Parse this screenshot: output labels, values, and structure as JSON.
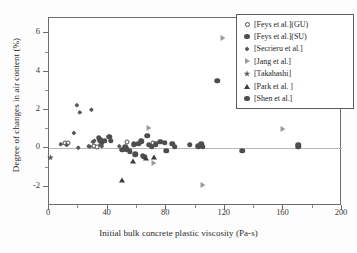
{
  "chart_data": {
    "type": "scatter",
    "title": "",
    "xlabel": "Initial bulk concrete plastic viscosity (Pa-s)",
    "ylabel": "Degree of changes in air content (%)",
    "xlim": [
      0,
      200
    ],
    "ylim": [
      -3,
      6.8
    ],
    "xticks": [
      0,
      40,
      80,
      120,
      160,
      200
    ],
    "yticks": [
      6,
      4,
      2,
      0,
      -2
    ],
    "grid": false,
    "zero_line": true,
    "legend_position": "top-right",
    "series": [
      {
        "name": "[Feys et al.](GU)",
        "marker": "open-circle",
        "color": "#4a4a4a",
        "points": [
          {
            "x": 11,
            "y": 0.3
          },
          {
            "x": 13,
            "y": 0.28
          },
          {
            "x": 31,
            "y": 0.12
          },
          {
            "x": 33,
            "y": 0.1
          },
          {
            "x": 53,
            "y": 0.34
          },
          {
            "x": 71,
            "y": 0.3
          }
        ]
      },
      {
        "name": "[Feys et al.](SU)",
        "marker": "filled-circle",
        "color": "#4e4e4e",
        "points": [
          {
            "x": 34,
            "y": 0.55
          },
          {
            "x": 35,
            "y": 0.42
          },
          {
            "x": 36,
            "y": 0.3
          },
          {
            "x": 38,
            "y": 0.4
          },
          {
            "x": 41,
            "y": 0.62
          },
          {
            "x": 42,
            "y": 0.4
          },
          {
            "x": 50,
            "y": -0.08
          },
          {
            "x": 52,
            "y": 0.05
          },
          {
            "x": 53,
            "y": -0.05
          },
          {
            "x": 55,
            "y": -0.15
          },
          {
            "x": 58,
            "y": 0.22
          },
          {
            "x": 59,
            "y": -0.3
          },
          {
            "x": 61,
            "y": 0.25
          },
          {
            "x": 63,
            "y": 0.38
          },
          {
            "x": 64,
            "y": -0.38
          },
          {
            "x": 65,
            "y": -0.42
          },
          {
            "x": 67,
            "y": 0.66
          },
          {
            "x": 68,
            "y": 0.2
          },
          {
            "x": 70,
            "y": 0.1
          },
          {
            "x": 73,
            "y": 0.22
          },
          {
            "x": 76,
            "y": 0.34
          },
          {
            "x": 79,
            "y": 0.3
          },
          {
            "x": 80,
            "y": -0.12
          },
          {
            "x": 84,
            "y": 0.25
          },
          {
            "x": 86,
            "y": 0.08
          },
          {
            "x": 96,
            "y": 0.18
          },
          {
            "x": 102,
            "y": 0.12
          },
          {
            "x": 104,
            "y": 0.22
          },
          {
            "x": 105,
            "y": 0.1
          }
        ]
      },
      {
        "name": "[Secrieru et al.]",
        "marker": "diamond",
        "color": "#5a5a5a",
        "points": [
          {
            "x": 8,
            "y": 0.22
          },
          {
            "x": 12,
            "y": 0.18
          },
          {
            "x": 17,
            "y": 0.8
          },
          {
            "x": 19,
            "y": 2.25
          },
          {
            "x": 20,
            "y": 0.04
          },
          {
            "x": 21,
            "y": 1.88
          },
          {
            "x": 27,
            "y": 0.12
          },
          {
            "x": 28,
            "y": 0.1
          },
          {
            "x": 29,
            "y": 2.02
          },
          {
            "x": 30,
            "y": 0.35
          },
          {
            "x": 31,
            "y": 0.4
          },
          {
            "x": 35,
            "y": 0.18
          },
          {
            "x": 36,
            "y": 0.12
          },
          {
            "x": 48,
            "y": 0.12
          }
        ]
      },
      {
        "name": "[Jang et al.]",
        "marker": "right-triangle",
        "color": "#9c9c9c",
        "points": [
          {
            "x": 68,
            "y": 1.05
          },
          {
            "x": 72,
            "y": -0.75
          },
          {
            "x": 105,
            "y": -1.88
          },
          {
            "x": 119,
            "y": 5.75
          },
          {
            "x": 160,
            "y": 1.02
          }
        ]
      },
      {
        "name": "[Takahashi]",
        "marker": "star",
        "color": "#5f5f5f",
        "points": [
          {
            "x": 1,
            "y": -0.48
          }
        ]
      },
      {
        "name": "[Park et al. ]",
        "marker": "up-triangle",
        "color": "#3d3d3d",
        "points": [
          {
            "x": 50,
            "y": -1.62
          },
          {
            "x": 57,
            "y": -0.68
          },
          {
            "x": 66,
            "y": -0.52
          },
          {
            "x": 72,
            "y": -0.42
          }
        ]
      },
      {
        "name": "[Shen et al.]",
        "marker": "filled-circle",
        "color": "#4e4e4e",
        "points": [
          {
            "x": 115,
            "y": 3.52
          },
          {
            "x": 132,
            "y": -0.12
          },
          {
            "x": 170,
            "y": 0.1
          },
          {
            "x": 170,
            "y": 0.2
          }
        ]
      }
    ]
  },
  "legend": {
    "entries": [
      {
        "label": "[Feys et al.](GU)",
        "marker": "open-circle"
      },
      {
        "label": "[Feys et al.](SU)",
        "marker": "filled-circle"
      },
      {
        "label": "[Secrieru et al.]",
        "marker": "diamond"
      },
      {
        "label": "[Jang et al.]",
        "marker": "right-triangle"
      },
      {
        "label": "[Takahashi]",
        "marker": "star"
      },
      {
        "label": "[Park et al. ]",
        "marker": "up-triangle"
      },
      {
        "label": "[Shen et al.]",
        "marker": "filled-circle"
      }
    ]
  }
}
